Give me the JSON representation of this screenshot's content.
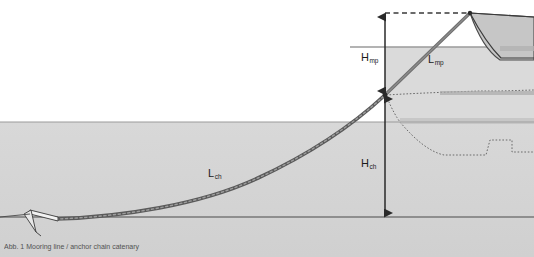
{
  "figure": {
    "title_caption": "Abb. 1 Mooring line / anchor chain catenary",
    "width": 534,
    "height": 257
  },
  "labels": {
    "h_mp": {
      "base": "H",
      "sub": "mp",
      "x": 361,
      "y": 52
    },
    "l_mp": {
      "base": "L",
      "sub": "mp",
      "x": 428,
      "y": 54
    },
    "h_ch": {
      "base": "H",
      "sub": "ch",
      "x": 361,
      "y": 158
    },
    "l_ch": {
      "base": "L",
      "sub": "ch",
      "x": 208,
      "y": 168
    }
  },
  "colors": {
    "water": "#d4d4d4",
    "sky": "#ffffff",
    "line_dark": "#3a3a3a",
    "mooring_line": "#7a7a7a",
    "chain": "#6e6e6e",
    "hull_fill": "#c2c2c2",
    "hull_stroke": "#5a5a5a",
    "seabed_line": "#4a4a4a",
    "waterline": "#8a8a8a",
    "dashed": "#4a4a4a",
    "text": "#1a1a1a"
  },
  "geometry": {
    "waterline_y": 122,
    "seabed_y": 217,
    "deck_line_y": 47,
    "dashed_top_y": 13,
    "vertical_axis_x": 385,
    "fairlead_x": 470,
    "fairlead_y": 13,
    "connection_x": 385,
    "connection_y": 95,
    "anchor_x": 32,
    "anchor_y": 219
  },
  "elements": {
    "anchor": "anchor-fluke",
    "chain": "catenary-anchor-chain",
    "mooring_line": "mooring-pendant-line",
    "vessel": "vessel-hull-profile",
    "ghost_vessel": "submerged-vessel-outline",
    "h_mp_arrow": "vertical-dimension-arrow-mp",
    "h_ch_arrow": "vertical-dimension-arrow-ch",
    "dashed_horizontal": "horizontal-reference-dashed-line"
  }
}
